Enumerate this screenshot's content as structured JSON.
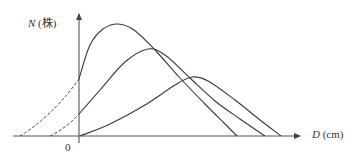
{
  "chart_data": {
    "type": "line",
    "title": "",
    "xlabel": "D (cm)",
    "ylabel": "N (株)",
    "xlabel_var": "D",
    "xlabel_unit": "(cm)",
    "ylabel_var": "N",
    "ylabel_unit": "(株)",
    "origin_label": "0",
    "grid": false,
    "legend": null,
    "note": "Schematic diameter-distribution curves (number of trees N vs. diameter D); no numeric ticks. Dashed segments are extrapolations left of the N axis.",
    "series": [
      {
        "name": "curve-1",
        "dashed_extension": {
          "start_px": [
            20,
            136
          ],
          "end_px": [
            79,
            79
          ]
        },
        "points_px": [
          [
            79,
            79
          ],
          [
            90,
            45
          ],
          [
            103,
            29
          ],
          [
            118,
            24
          ],
          [
            134,
            30
          ],
          [
            155,
            50
          ],
          [
            180,
            78
          ],
          [
            205,
            104
          ],
          [
            225,
            124
          ],
          [
            237,
            136
          ]
        ],
        "peak_px": [
          118,
          24
        ]
      },
      {
        "name": "curve-2",
        "dashed_extension": {
          "start_px": [
            50,
            136
          ],
          "end_px": [
            79,
            114
          ]
        },
        "points_px": [
          [
            79,
            114
          ],
          [
            100,
            90
          ],
          [
            125,
            62
          ],
          [
            148,
            49
          ],
          [
            165,
            55
          ],
          [
            190,
            78
          ],
          [
            215,
            101
          ],
          [
            240,
            119
          ],
          [
            265,
            136
          ]
        ],
        "peak_px": [
          148,
          49
        ]
      },
      {
        "name": "curve-3",
        "dashed_extension": null,
        "points_px": [
          [
            80,
            136
          ],
          [
            110,
            124
          ],
          [
            145,
            105
          ],
          [
            175,
            85
          ],
          [
            192,
            77
          ],
          [
            208,
            81
          ],
          [
            235,
            100
          ],
          [
            260,
            120
          ],
          [
            281,
            136
          ]
        ],
        "peak_px": [
          192,
          77
        ]
      }
    ],
    "axes": {
      "x_axis_px": {
        "x0": 13,
        "x1": 300,
        "y": 136
      },
      "y_axis_px": {
        "x": 79,
        "y0": 143,
        "y1": 12
      }
    }
  },
  "colors": {
    "line": "#3a3a3a",
    "axis": "#555555",
    "text": "#333333"
  }
}
